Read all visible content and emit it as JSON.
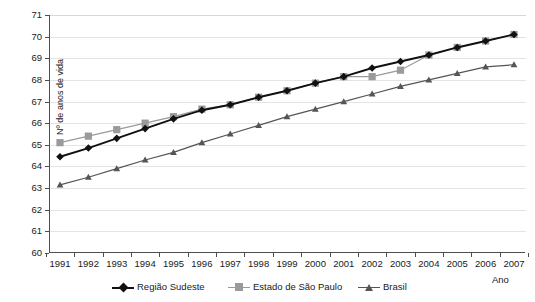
{
  "chart_data": {
    "type": "line",
    "title": "",
    "xlabel": "Ano",
    "ylabel": "Nº de anos de vida",
    "ylim": [
      60,
      71
    ],
    "ytick_step": 1,
    "grid": true,
    "legend_position": "bottom",
    "categories": [
      1991,
      1992,
      1993,
      1994,
      1995,
      1996,
      1997,
      1998,
      1999,
      2000,
      2001,
      2002,
      2003,
      2004,
      2005,
      2006,
      2007
    ],
    "x_tick_labels": [
      "1991",
      "1992",
      "1993",
      "1994",
      "1995",
      "1996",
      "1997",
      "1998",
      "1999",
      "2000",
      "2001",
      "2002",
      "2003",
      "2004",
      "2005",
      "2006",
      "2007"
    ],
    "y_tick_labels": [
      "60",
      "61",
      "62",
      "63",
      "64",
      "65",
      "66",
      "67",
      "68",
      "69",
      "70",
      "71"
    ],
    "series": [
      {
        "name": "Região Sudeste",
        "color": "#111111",
        "marker": "diamond",
        "values": [
          64.45,
          64.85,
          65.3,
          65.75,
          66.2,
          66.6,
          66.85,
          67.2,
          67.5,
          67.85,
          68.15,
          68.55,
          68.85,
          69.15,
          69.5,
          69.8,
          70.1
        ]
      },
      {
        "name": "Estado de São Paulo",
        "color": "#9a9a9a",
        "marker": "square",
        "values": [
          65.1,
          65.4,
          65.7,
          66.0,
          66.3,
          66.65,
          66.85,
          67.2,
          67.5,
          67.85,
          68.15,
          68.15,
          68.45,
          69.15,
          69.5,
          69.8,
          70.1
        ]
      },
      {
        "name": "Brasil",
        "color": "#555555",
        "marker": "triangle",
        "values": [
          63.15,
          63.5,
          63.9,
          64.3,
          64.65,
          65.1,
          65.5,
          65.9,
          66.3,
          66.65,
          67.0,
          67.35,
          67.7,
          68.0,
          68.3,
          68.6,
          68.7
        ]
      }
    ]
  },
  "axes": {
    "y_title": "Nº de anos de vida",
    "x_title": "Ano"
  },
  "legend": {
    "items": [
      {
        "label": "Região Sudeste",
        "marker": "diamond-marker",
        "color": "#111111"
      },
      {
        "label": "Estado de São Paulo",
        "marker": "square-marker",
        "color": "#9a9a9a"
      },
      {
        "label": "Brasil",
        "marker": "triangle-marker",
        "color": "#555555"
      }
    ]
  }
}
